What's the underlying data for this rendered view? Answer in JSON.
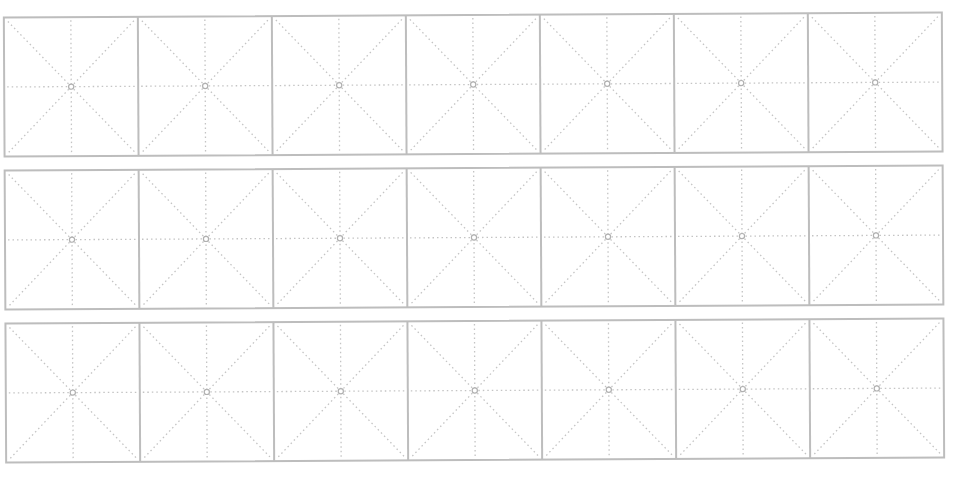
{
  "sheet": {
    "type": "mi-zi-ge calligraphy practice grid",
    "rows": 3,
    "cols": 7,
    "rotation_deg": -0.3,
    "origin_x": 5,
    "cell_width": 134,
    "cell_height": 139,
    "row_tops": [
      15,
      168,
      321
    ],
    "colors": {
      "border": "#bdbdbd",
      "guide": "#c4c4c4",
      "center_dot": "#b0b0b0",
      "background": "#ffffff"
    }
  }
}
